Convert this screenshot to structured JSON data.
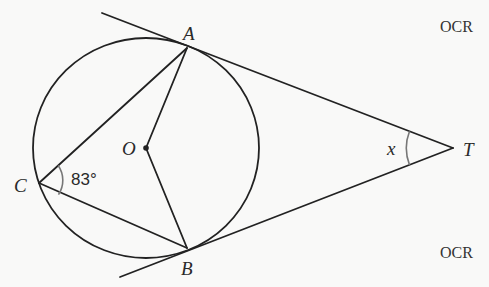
{
  "diagram": {
    "points": {
      "A": {
        "label": "A",
        "x": 187,
        "y": 48
      },
      "B": {
        "label": "B",
        "x": 187,
        "y": 248
      },
      "C": {
        "label": "C",
        "x": 39,
        "y": 183
      },
      "O": {
        "label": "O",
        "x": 146,
        "y": 148
      },
      "T": {
        "label": "T",
        "x": 453,
        "y": 148
      }
    },
    "circle": {
      "center": "O",
      "cx": 146,
      "cy": 148,
      "rx": 113,
      "ry": 110
    },
    "segments": [
      [
        "C",
        "A"
      ],
      [
        "C",
        "B"
      ],
      [
        "O",
        "A"
      ],
      [
        "O",
        "B"
      ]
    ],
    "tangent_lines": [
      {
        "through": "A",
        "to": "T",
        "from_x": 102,
        "from_y": 13
      },
      {
        "through": "B",
        "to": "T",
        "from_x": 120,
        "from_y": 277
      }
    ],
    "angles": {
      "C": {
        "vertex": "C",
        "label": "83°",
        "value_degrees": 83
      },
      "T": {
        "vertex": "T",
        "label": "x",
        "value": "unknown"
      }
    },
    "colors": {
      "line": "#222222",
      "angle_arc": "#777777",
      "background": "#f9f9f8"
    }
  },
  "watermarks": {
    "top": "OCR",
    "bottom": "OCR"
  }
}
